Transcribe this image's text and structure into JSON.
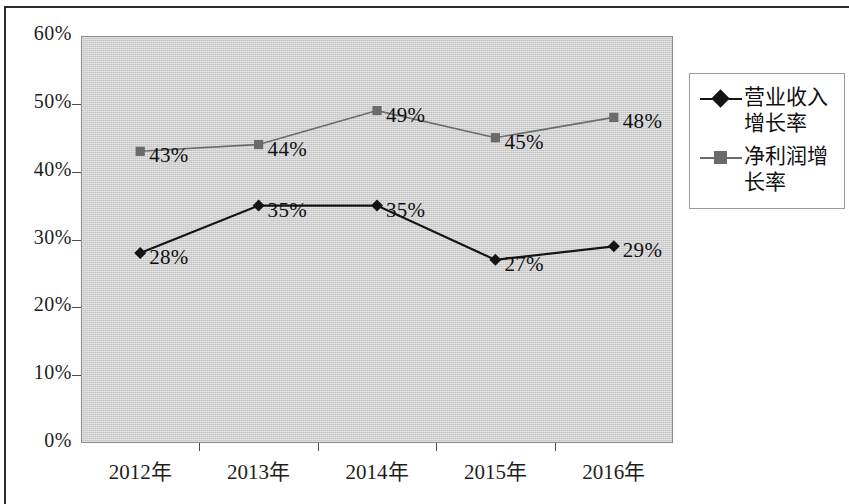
{
  "chart_data": {
    "type": "line",
    "title": "",
    "subtitle": "",
    "xlabel": "",
    "ylabel": "",
    "categories": [
      "2012年",
      "2013年",
      "2014年",
      "2015年",
      "2016年"
    ],
    "ylim": [
      0,
      60
    ],
    "ytick_labels": [
      "60%",
      "50%",
      "40%",
      "30%",
      "20%",
      "10%",
      "0%"
    ],
    "ytick_values": [
      60,
      50,
      40,
      30,
      20,
      10,
      0
    ],
    "grid": false,
    "legend_position": "right",
    "plot_background": "#d2d2d2",
    "series": [
      {
        "name": "营业收入增长率",
        "marker": "diamond",
        "color": "#141414",
        "values": [
          28,
          35,
          35,
          27,
          29
        ],
        "data_labels": [
          "28%",
          "35%",
          "35%",
          "27%",
          "29%"
        ]
      },
      {
        "name": "净利润增长率",
        "marker": "square",
        "color": "#6b6b6b",
        "values": [
          43,
          44,
          49,
          45,
          48
        ],
        "data_labels": [
          "43%",
          "44%",
          "49%",
          "45%",
          "48%"
        ]
      }
    ]
  },
  "legend": {
    "entries": [
      {
        "label": "营业收入增长率",
        "marker": "diamond",
        "color": "#141414"
      },
      {
        "label": "净利润增长率",
        "marker": "square",
        "color": "#6b6b6b"
      }
    ]
  }
}
